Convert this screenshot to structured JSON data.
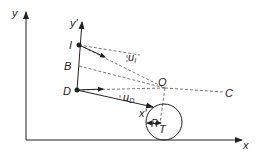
{
  "diagram": {
    "type": "geometry-coordinate-frames",
    "axes": {
      "world_x": "x",
      "world_y": "y",
      "local_x": "x'",
      "local_y": "y'"
    },
    "points": {
      "I": "I",
      "B": "B",
      "D": "D",
      "O": "O",
      "C": "C",
      "T": "T"
    },
    "vectors": {
      "u_I": {
        "base": "u",
        "sub": "I"
      },
      "u_D": {
        "base": "u",
        "sub": "D"
      }
    },
    "radius_label": "R",
    "colors": {
      "stroke": "#222222",
      "dashed": "#555555",
      "background": "#ffffff"
    }
  }
}
